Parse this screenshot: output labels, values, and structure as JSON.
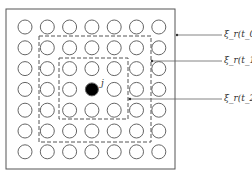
{
  "diagram": {
    "grid": {
      "rows": 7,
      "cols": 7,
      "center_node_label": "j",
      "center_row": 3,
      "center_col": 3
    },
    "labels": [
      {
        "id": "t0",
        "text": "ξ_r(t_0)"
      },
      {
        "id": "t1",
        "text": "ξ_r(t_1)"
      },
      {
        "id": "t2",
        "text": "ξ_r(t_2)"
      }
    ],
    "colors": {
      "line": "#555555",
      "node_fill": "#000000",
      "node_outline": "#666666"
    }
  }
}
